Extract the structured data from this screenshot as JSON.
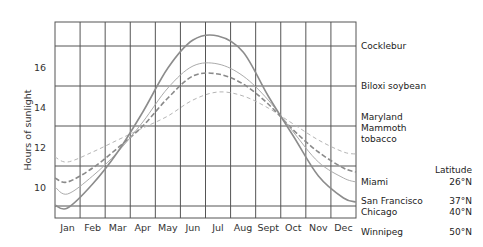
{
  "chart_data": {
    "type": "line",
    "title": "",
    "xlabel": "",
    "ylabel": "Hours of sunlight",
    "categories": [
      "Jan",
      "Feb",
      "Mar",
      "Apr",
      "May",
      "Jun",
      "Jul",
      "Aug",
      "Sept",
      "Oct",
      "Nov",
      "Dec"
    ],
    "y_ticks": [
      10,
      12,
      14,
      16
    ],
    "ylim": [
      8.5,
      18.3
    ],
    "grid": true,
    "critical_photoperiods": [
      {
        "plant": "Cocklebur",
        "hours": 17.1
      },
      {
        "plant": "Biloxi soybean",
        "hours": 15.1
      },
      {
        "plant": "Maryland Mammoth tobacco",
        "hours": 13.1
      }
    ],
    "legend_header": "Latitude",
    "series": [
      {
        "name": "Miami",
        "latitude": "26°N",
        "style": "dashed-thin",
        "color": "#b5b5b5",
        "width": 1,
        "values": [
          11.3,
          11.8,
          12.4,
          13.0,
          13.6,
          14.4,
          14.8,
          14.6,
          14.0,
          13.2,
          12.4,
          11.8
        ]
      },
      {
        "name": "San Francisco",
        "latitude": "37°N",
        "style": "dashed",
        "color": "#8a8a8a",
        "width": 1.6,
        "values": [
          10.3,
          11.0,
          12.0,
          13.1,
          14.5,
          15.6,
          15.7,
          15.2,
          14.2,
          12.9,
          11.8,
          11.0
        ]
      },
      {
        "name": "Chicago",
        "latitude": "40°N",
        "style": "solid-thin",
        "color": "#ababab",
        "width": 1,
        "values": [
          9.7,
          10.6,
          11.8,
          13.3,
          15.0,
          16.1,
          16.2,
          15.6,
          14.4,
          12.8,
          11.3,
          10.5
        ]
      },
      {
        "name": "Winnipeg",
        "latitude": "50°N",
        "style": "solid",
        "color": "#8c8c8c",
        "width": 1.6,
        "values": [
          9.0,
          10.2,
          11.8,
          13.8,
          16.0,
          17.4,
          17.6,
          16.8,
          14.6,
          12.6,
          10.6,
          9.5
        ]
      }
    ],
    "series_endpoints": {
      "Miami": {
        "start": 11.55,
        "end": 11.7
      },
      "San Francisco": {
        "start": 10.5,
        "end": 10.8
      },
      "Chicago": {
        "start": 10.05,
        "end": 10.3
      },
      "Winnipeg": {
        "start": 9.15,
        "end": 9.3
      }
    }
  }
}
